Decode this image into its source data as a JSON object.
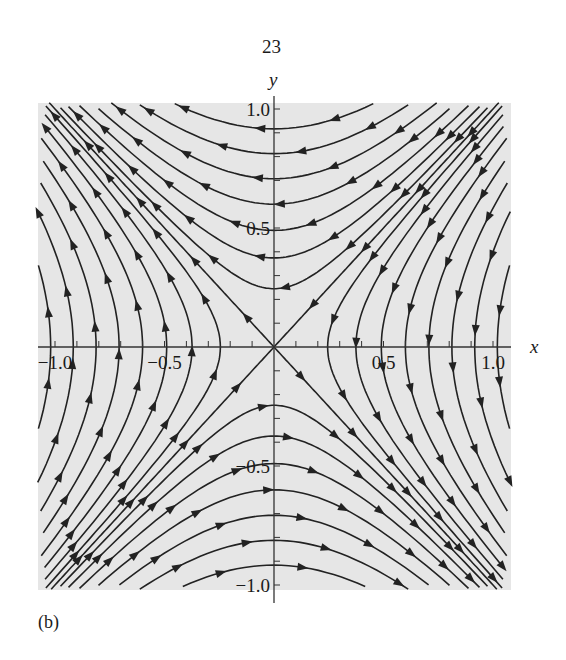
{
  "page": {
    "number": "23",
    "figure_label": "(b)"
  },
  "chart_data": {
    "type": "streamplot",
    "title": "",
    "xlabel": "x",
    "ylabel": "y",
    "vector_field": {
      "dx_dt": "-y",
      "dy_dt": "-x"
    },
    "xlim": [
      -1.08,
      1.08
    ],
    "ylim": [
      -1.02,
      1.03
    ],
    "x_ticks": [
      -1.0,
      -0.5,
      0.5,
      1.0
    ],
    "x_tick_labels": [
      "-1.0",
      "-0.5",
      "0.5",
      "1.0"
    ],
    "y_ticks": [
      -1.0,
      -0.5,
      0.5,
      1.0
    ],
    "y_tick_labels": [
      "-1.0",
      "-0.5",
      "0.5",
      "1.0"
    ],
    "minor_tick_step": 0.1,
    "grid": false,
    "background": "#e6e6e6",
    "line_color": "#222222",
    "separatrices": [
      {
        "line": "y = x",
        "direction": "toward origin"
      },
      {
        "line": "y = -x",
        "direction": "away from origin"
      }
    ],
    "streamline_constants_vertical_branches": [
      0.06,
      0.14,
      0.24,
      0.36,
      0.5,
      0.66,
      0.84,
      1.04
    ],
    "streamline_constants_horizontal_branches": [
      0.06,
      0.14,
      0.24,
      0.36,
      0.5,
      0.66,
      0.84
    ],
    "extra_diagonal_offsets": [
      0.18,
      0.36,
      0.54,
      0.72,
      0.9
    ]
  }
}
